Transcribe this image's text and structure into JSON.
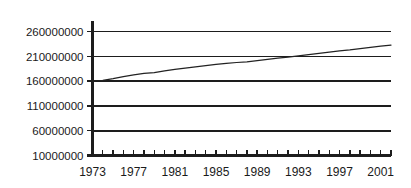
{
  "chart_data": {
    "type": "line",
    "title": "",
    "subtitle": "",
    "xlabel": "",
    "ylabel": "",
    "grid": true,
    "legend": false,
    "legend_position": "none",
    "line_color": "#222222",
    "axis_color": "#1d1d1d",
    "background_color": "#ffffff",
    "xlim": [
      1973,
      2002
    ],
    "ylim": [
      10000000,
      260000000
    ],
    "y_ticks": [
      {
        "value": 10000000,
        "label": "10000000"
      },
      {
        "value": 60000000,
        "label": "60000000"
      },
      {
        "value": 110000000,
        "label": "110000000"
      },
      {
        "value": 160000000,
        "label": "160000000"
      },
      {
        "value": 210000000,
        "label": "210000000"
      },
      {
        "value": 260000000,
        "label": "260000000"
      }
    ],
    "x_ticks_major": [
      {
        "value": 1973,
        "label": "1973"
      },
      {
        "value": 1977,
        "label": "1977"
      },
      {
        "value": 1981,
        "label": "1981"
      },
      {
        "value": 1985,
        "label": "1985"
      },
      {
        "value": 1989,
        "label": "1989"
      },
      {
        "value": 1993,
        "label": "1993"
      },
      {
        "value": 1997,
        "label": "1997"
      },
      {
        "value": 2001,
        "label": "2001"
      }
    ],
    "x_minor_tick_interval": 1,
    "series": [
      {
        "name": "series-1",
        "x": [
          1973,
          1974,
          1975,
          1976,
          1977,
          1978,
          1979,
          1980,
          1981,
          1982,
          1983,
          1984,
          1985,
          1986,
          1987,
          1988,
          1989,
          1990,
          1991,
          1992,
          1993,
          1994,
          1995,
          1996,
          1997,
          1998,
          1999,
          2000,
          2001,
          2002
        ],
        "values": [
          160000000,
          161500000,
          165000000,
          169000000,
          172500000,
          175500000,
          177000000,
          180500000,
          183500000,
          186000000,
          188500000,
          191000000,
          193500000,
          195500000,
          197500000,
          199000000,
          201500000,
          204000000,
          206500000,
          208500000,
          211000000,
          213500000,
          216000000,
          218500000,
          221000000,
          223000000,
          225500000,
          228000000,
          230500000,
          232500000
        ]
      }
    ]
  }
}
